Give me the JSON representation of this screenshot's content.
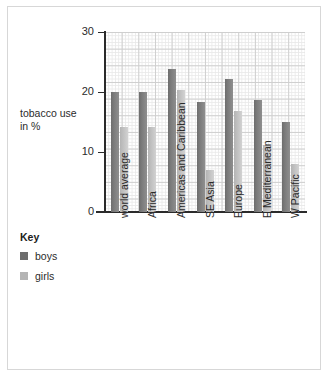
{
  "axis_title": {
    "line1": "tobacco use",
    "line2": "in %"
  },
  "legend": {
    "title": "Key",
    "entries": [
      {
        "label": "boys",
        "color": "#6d6d6d"
      },
      {
        "label": "girls",
        "color": "#b4b4b4"
      }
    ]
  },
  "chart_data": {
    "type": "bar",
    "title": "",
    "xlabel": "",
    "ylabel": "tobacco use in %",
    "ylim": [
      0,
      30
    ],
    "yticks": [
      0,
      10,
      20,
      30
    ],
    "ytick_labels": [
      "0",
      "10",
      "20",
      "30"
    ],
    "grid": true,
    "grid_style": "graph-paper",
    "legend_position": "left",
    "categories": [
      "world average",
      "Africa",
      "Americas and Caribbean",
      "SE Asia",
      "Europe",
      "E Mediterranean",
      "W Pacific"
    ],
    "series": [
      {
        "name": "boys",
        "color": "#6d6d6d",
        "values": [
          20,
          20,
          23.8,
          18.4,
          22.1,
          18.7,
          15
        ]
      },
      {
        "name": "girls",
        "color": "#b4b4b4",
        "values": [
          14.2,
          14.2,
          20.4,
          7,
          16.9,
          11.1,
          8
        ]
      }
    ]
  }
}
